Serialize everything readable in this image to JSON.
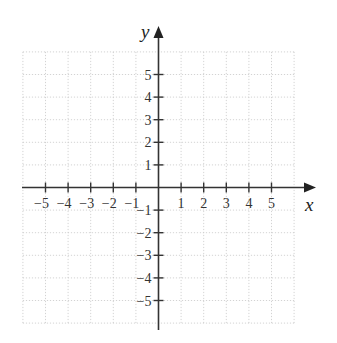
{
  "diagram": {
    "type": "coordinate-plane",
    "x_axis": {
      "label": "x",
      "tick_labels": [
        "−5",
        "−4",
        "−3",
        "−2",
        "−1",
        "1",
        "2",
        "3",
        "4",
        "5"
      ],
      "tick_values": [
        -5,
        -4,
        -3,
        -2,
        -1,
        1,
        2,
        3,
        4,
        5
      ]
    },
    "y_axis": {
      "label": "y",
      "tick_labels": [
        "5",
        "4",
        "3",
        "2",
        "1",
        "−1",
        "−2",
        "−3",
        "−4",
        "−5"
      ],
      "tick_values": [
        5,
        4,
        3,
        2,
        1,
        -1,
        -2,
        -3,
        -4,
        -5
      ]
    },
    "grid": {
      "min": -6,
      "max": 6,
      "style": "dotted"
    },
    "colors": {
      "axis": "#333333",
      "grid": "#c8c8c8",
      "text": "#333333"
    }
  }
}
